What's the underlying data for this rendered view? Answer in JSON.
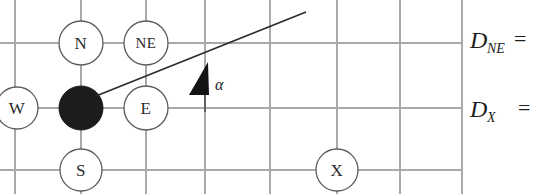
{
  "figure": {
    "colors": {
      "grid_line": "#a9a9ad",
      "node_stroke": "#5b5b60",
      "node_fill": "#ffffff",
      "occupied_node_fill": "#1c1c1c",
      "direction_line": "#2a2a2a",
      "arrow_fill": "#141414",
      "text": "#1d1d1d",
      "background": "#ffffff"
    },
    "grid": {
      "vertical_lines_x": [
        15,
        81,
        146,
        205,
        270,
        335,
        400,
        462
      ],
      "horizontal_lines_y": [
        43,
        108,
        170
      ],
      "cell_size": 65
    },
    "nodes": [
      {
        "id": "N",
        "label": "N",
        "cx": 81,
        "cy": 43,
        "r": 22,
        "state": "empty"
      },
      {
        "id": "NE",
        "label": "NE",
        "cx": 146,
        "cy": 43,
        "r": 22,
        "state": "empty"
      },
      {
        "id": "W",
        "label": "W",
        "cx": 17,
        "cy": 108,
        "r": 21,
        "state": "empty"
      },
      {
        "id": "C",
        "label": "",
        "cx": 81,
        "cy": 108,
        "r": 22,
        "state": "occupied"
      },
      {
        "id": "E",
        "label": "E",
        "cx": 146,
        "cy": 108,
        "r": 22,
        "state": "empty"
      },
      {
        "id": "S",
        "label": "S",
        "cx": 81,
        "cy": 170,
        "r": 21,
        "state": "empty"
      },
      {
        "id": "X",
        "label": "X",
        "cx": 337,
        "cy": 170,
        "r": 21,
        "state": "empty"
      }
    ],
    "direction_line": {
      "x1": 96,
      "y1": 96,
      "x2": 306,
      "y2": 12,
      "description": "heading ray from occupied node"
    },
    "angle_marker": {
      "label": "α",
      "label_x": 215,
      "label_y": 86,
      "arrow_tip_x": 208,
      "arrow_tip_y": 62,
      "stem_x": 205,
      "stem_y1": 94,
      "stem_y2": 112
    },
    "annotations": [
      {
        "id": "d-ne",
        "base": "D",
        "subscript": "NE",
        "equals": "=",
        "x": 470,
        "y": 43
      },
      {
        "id": "d-x",
        "base": "D",
        "subscript": "X",
        "equals": "=",
        "x": 470,
        "y": 112
      }
    ]
  }
}
